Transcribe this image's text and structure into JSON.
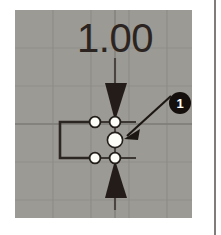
{
  "viewport": {
    "name": "sketch-viewport",
    "background_color": "#9c9a95",
    "grid_color": "#8d8b86",
    "grid_spacing": 38,
    "page_background": "#ffffff",
    "edge_rule_color": "#4a4540"
  },
  "dimension": {
    "label": "1.00",
    "label_color": "#2b2420",
    "line_color": "#3a3330",
    "arrow_color": "#241c18",
    "orientation": "vertical"
  },
  "geometry": {
    "rectangle": {
      "name": "sketch-rectangle",
      "stroke_color": "#2b2622"
    },
    "nodes": [
      {
        "name": "node-top-left",
        "state": "normal"
      },
      {
        "name": "node-bottom-left",
        "state": "normal"
      },
      {
        "name": "node-top-right",
        "state": "normal"
      },
      {
        "name": "node-bottom-right",
        "state": "normal"
      },
      {
        "name": "node-center-selected",
        "state": "selected"
      }
    ],
    "node_fill": "#fdfdf8",
    "node_stroke": "#231e1a"
  },
  "callout": {
    "number": "1",
    "badge_color": "#140f0c",
    "text_color": "#ffffff",
    "leader_color": "#1d1714",
    "target": "node-center-selected"
  }
}
